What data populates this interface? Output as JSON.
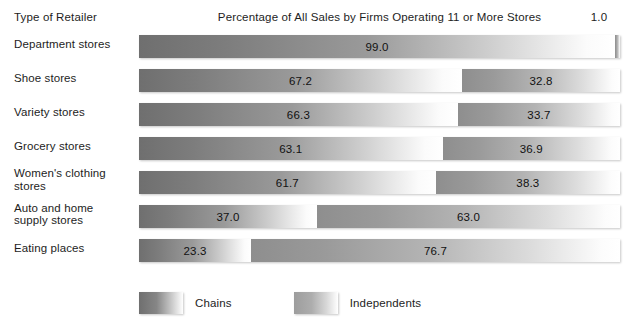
{
  "header": {
    "category_axis_label": "Type of Retailer",
    "title": "Percentage of All Sales by Firms Operating 11 or More Stores",
    "max_label": "1.0"
  },
  "legend": {
    "items": [
      {
        "label": "Chains",
        "swatch": "chains-gradient-swatch",
        "color": "#6f6f6f"
      },
      {
        "label": "Independents",
        "swatch": "independents-gradient-swatch",
        "color": "#9d9d9d"
      }
    ]
  },
  "rows": [
    {
      "label": "Department stores",
      "chains": "99.0",
      "independents": "1.0"
    },
    {
      "label": "Shoe stores",
      "chains": "67.2",
      "independents": "32.8"
    },
    {
      "label": "Variety stores",
      "chains": "66.3",
      "independents": "33.7"
    },
    {
      "label": "Grocery stores",
      "chains": "63.1",
      "independents": "36.9"
    },
    {
      "label": "Women's clothing stores",
      "chains": "61.7",
      "independents": "38.3"
    },
    {
      "label": "Auto and home\nsupply stores",
      "chains": "37.0",
      "independents": "63.0"
    },
    {
      "label": "Eating places",
      "chains": "23.3",
      "independents": "76.7"
    }
  ],
  "chart_data": {
    "type": "bar",
    "orientation": "horizontal",
    "stacked": true,
    "normalized": true,
    "title": "Percentage of All Sales by Firms Operating 11 or More Stores",
    "xlabel": "",
    "ylabel": "Type of Retailer",
    "xlim": [
      0,
      1.0
    ],
    "xtick_labels": [
      "1.0"
    ],
    "grid": false,
    "legend_position": "bottom-left",
    "categories": [
      "Department stores",
      "Shoe stores",
      "Variety stores",
      "Grocery stores",
      "Women's clothing stores",
      "Auto and home supply stores",
      "Eating places"
    ],
    "series": [
      {
        "name": "Chains",
        "values": [
          99.0,
          67.2,
          66.3,
          63.1,
          61.7,
          37.0,
          23.3
        ]
      },
      {
        "name": "Independents",
        "values": [
          1.0,
          32.8,
          33.7,
          36.9,
          38.3,
          63.0,
          76.7
        ]
      }
    ],
    "units": "percent"
  }
}
